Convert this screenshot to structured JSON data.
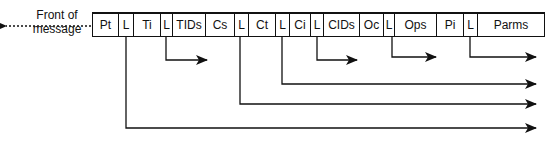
{
  "front_label": {
    "line1": "Front of",
    "line2": "message"
  },
  "fields": [
    {
      "label": "Pt",
      "width": 26
    },
    {
      "label": "L",
      "width": 15
    },
    {
      "label": "Ti",
      "width": 27
    },
    {
      "label": "L",
      "width": 12
    },
    {
      "label": "TIDs",
      "width": 33
    },
    {
      "label": "Cs",
      "width": 29
    },
    {
      "label": "L",
      "width": 14
    },
    {
      "label": "Ct",
      "width": 27
    },
    {
      "label": "L",
      "width": 14
    },
    {
      "label": "Ci",
      "width": 21
    },
    {
      "label": "L",
      "width": 13
    },
    {
      "label": "CIDs",
      "width": 36
    },
    {
      "label": "Oc",
      "width": 24
    },
    {
      "label": "L",
      "width": 11
    },
    {
      "label": "Ops",
      "width": 42
    },
    {
      "label": "Pi",
      "width": 27
    },
    {
      "label": "L",
      "width": 14
    },
    {
      "label": "Parms",
      "width": 66
    }
  ],
  "arrows": [
    {
      "from_field": "L (after Ti)",
      "x": 166,
      "y": 60,
      "end_x": 207
    },
    {
      "from_field": "L (after CIDs)",
      "x": 317,
      "y": 60,
      "end_x": 357
    },
    {
      "from_field": "L (after Oc)",
      "x": 392,
      "y": 57,
      "end_x": 436
    },
    {
      "from_field": "L (after Pi)",
      "x": 470,
      "y": 57,
      "end_x": 536
    },
    {
      "from_field": "L (after Ct)",
      "x": 282,
      "y": 84,
      "end_x": 536
    },
    {
      "from_field": "L (after Cs)",
      "x": 240,
      "y": 104,
      "end_x": 536
    },
    {
      "from_field": "L (after Pt)",
      "x": 126,
      "y": 128,
      "end_x": 536
    }
  ]
}
